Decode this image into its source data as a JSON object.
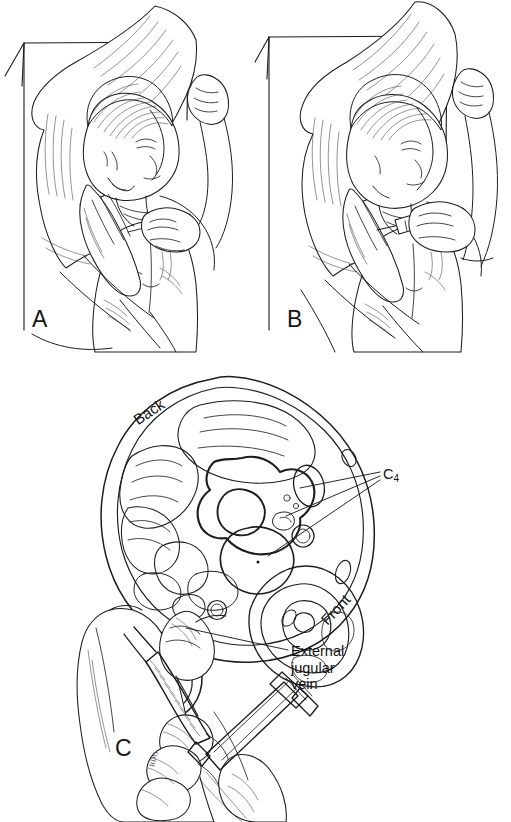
{
  "figure": {
    "type": "medical-line-illustration",
    "background_color": "#ffffff",
    "ink_color": "#1d1d1d",
    "width": 511,
    "height": 822
  },
  "panels": [
    {
      "letter": "A",
      "name": "panel-a",
      "caption": "Patient supine on pillow, head turned; operator palpates posterior border of sternocleidomastoid with left hand while holding syringe in right hand",
      "scene": {
        "subject": "shirtless patient lying supine with head turned to the side on a pillow",
        "pillow": "large pillow supporting head and upper shoulder",
        "bed_frame": "rectangular bed/table outline behind patient",
        "operator_hands": [
          "palpating-hand-at-neck",
          "syringe-holding-hand"
        ],
        "syringe": "syringe held over the chest, needle not yet inserted"
      }
    },
    {
      "letter": "B",
      "name": "panel-b",
      "caption": "Needle introduced at the midpoint of the posterior border of the sternocleidomastoid muscle",
      "scene": {
        "subject": "shirtless patient lying supine with head turned to the side on a pillow",
        "pillow": "large pillow supporting head and upper shoulder",
        "bed_frame": "rectangular bed/table outline behind patient",
        "operator_hands": [
          "palpating-hand-at-neck",
          "syringe-holding-hand"
        ],
        "syringe": "syringe angled against the neck with needle entering the skin"
      }
    },
    {
      "letter": "C",
      "name": "panel-c",
      "caption": "Cross-sectional anatomy at the level of the fourth cervical vertebra showing needle direction",
      "scene": {
        "cross_section": "axial section of the neck at C4 with vertebral body, spinal cord, vessels and muscles",
        "operator_hands": [
          "palpating-finger-on-neck",
          "syringe-holding-hand"
        ],
        "syringe": "syringe with long needle directed medially and caudally toward the transverse process"
      }
    }
  ],
  "annotations": [
    {
      "name": "label-back",
      "text": "Back",
      "rotation_deg": -34
    },
    {
      "name": "label-front",
      "text": "Front",
      "rotation_deg": -47
    },
    {
      "name": "label-c4",
      "text": "C",
      "subscript": "4",
      "leader_lines": 3
    },
    {
      "name": "label-external-jugular-vein",
      "lines": [
        "External",
        "jugular",
        "vein"
      ],
      "leader_lines": 1
    }
  ],
  "signature": {
    "name": "artist-signature",
    "text": "BDG"
  }
}
